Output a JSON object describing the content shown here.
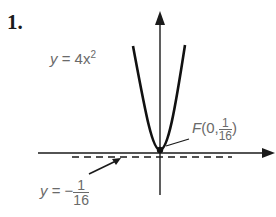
{
  "problem_number": "1.",
  "labels": {
    "parabola_eq": {
      "lhs": "y",
      "eq": " = 4",
      "var": "x",
      "exp": "2"
    },
    "focus": {
      "name": "F",
      "open": "(0,",
      "num": "1",
      "den": "16",
      "close": ")"
    },
    "directrix": {
      "lhs": "y",
      "eq": " = −",
      "num": "1",
      "den": "16"
    }
  },
  "colors": {
    "axes": "#1a1a1a",
    "curve": "#111111",
    "text": "#6a6a6a"
  }
}
